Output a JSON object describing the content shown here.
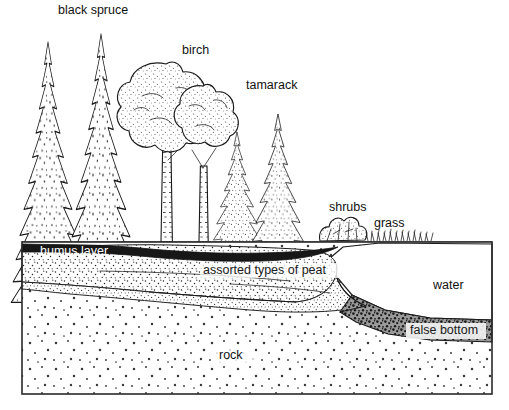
{
  "diagram": {
    "style": "black-and-white pen-and-ink stipple illustration",
    "background_color": "#ffffff",
    "ink_color": "#1a1a1a",
    "canvas": {
      "width": 509,
      "height": 410
    },
    "ground_line_y": 242,
    "frame": {
      "x": 22,
      "y": 242,
      "width": 470,
      "height": 152
    }
  },
  "vegetation_labels": [
    {
      "id": "black-spruce",
      "text": "black spruce",
      "x": 58,
      "y": 11,
      "anchor": "start"
    },
    {
      "id": "birch",
      "text": "birch",
      "x": 182,
      "y": 51,
      "anchor": "start"
    },
    {
      "id": "tamarack",
      "text": "tamarack",
      "x": 246,
      "y": 86,
      "anchor": "start"
    },
    {
      "id": "shrubs",
      "text": "shrubs",
      "x": 329,
      "y": 208,
      "anchor": "start"
    },
    {
      "id": "grass",
      "text": "grass",
      "x": 374,
      "y": 224,
      "anchor": "start"
    }
  ],
  "substrate_labels": [
    {
      "id": "humus-layer",
      "text": "humus layer",
      "x": 40,
      "y": 252,
      "anchor": "start",
      "style": "white-on-dark"
    },
    {
      "id": "assorted-types-of-peat",
      "text": "assorted types of peat",
      "x": 203,
      "y": 271,
      "anchor": "start",
      "style": "dark-on-stipple"
    },
    {
      "id": "water",
      "text": "water",
      "x": 433,
      "y": 286,
      "anchor": "start",
      "style": "dark-on-white"
    },
    {
      "id": "false-bottom",
      "text": "false bottom",
      "x": 410,
      "y": 331,
      "anchor": "start",
      "style": "dark-on-light-band"
    },
    {
      "id": "rock",
      "text": "rock",
      "x": 219,
      "y": 356,
      "anchor": "start",
      "style": "dark-on-stipple"
    }
  ],
  "layers": [
    {
      "id": "humus-layer",
      "name": "humus layer",
      "fill": "#1a1a1a",
      "description": "thin dark organic band directly under the forest floor"
    },
    {
      "id": "peat-layer",
      "name": "assorted types of peat",
      "fill": "#ffffff",
      "description": "stippled wedge of peat thinning toward the open water"
    },
    {
      "id": "water-body",
      "name": "water",
      "fill": "#ffffff",
      "description": "open water of the bog pond on the right"
    },
    {
      "id": "false-bottom",
      "name": "false bottom",
      "fill": "#2b2b2b",
      "description": "dark sediment band beneath the water, above bedrock"
    },
    {
      "id": "rock-layer",
      "name": "rock",
      "fill": "#ffffff",
      "description": "stippled bedrock filling the lower part of the section"
    }
  ],
  "plants": [
    {
      "id": "black-spruce-1",
      "type": "spruce",
      "x": 48,
      "base_y": 242,
      "height": 200,
      "half_width": 40
    },
    {
      "id": "black-spruce-2",
      "type": "spruce",
      "x": 100,
      "base_y": 242,
      "height": 208,
      "half_width": 40
    },
    {
      "id": "birch-1",
      "type": "birch",
      "x": 165,
      "base_y": 242,
      "height": 182,
      "half_width": 42
    },
    {
      "id": "birch-2",
      "type": "birch",
      "x": 202,
      "base_y": 242,
      "height": 160,
      "half_width": 34
    },
    {
      "id": "tamarack-1",
      "type": "tamarack",
      "x": 237,
      "base_y": 242,
      "height": 112,
      "half_width": 26
    },
    {
      "id": "tamarack-2",
      "type": "tamarack",
      "x": 277,
      "base_y": 242,
      "height": 130,
      "half_width": 28
    },
    {
      "id": "shrub-clump",
      "type": "shrub",
      "x": 340,
      "base_y": 241,
      "height": 26,
      "half_width": 22
    },
    {
      "id": "grass-fringe",
      "type": "grass",
      "x": 398,
      "base_y": 241,
      "height": 9,
      "half_width": 32
    }
  ]
}
